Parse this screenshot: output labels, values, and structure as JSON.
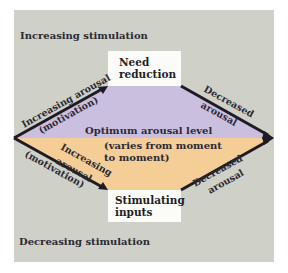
{
  "diagram": {
    "top_label": "Increasing stimulation",
    "bottom_label": "Decreasing stimulation",
    "top_box": {
      "line1": "Need",
      "line2": "reduction"
    },
    "bottom_box": {
      "line1": "Stimulating",
      "line2": "inputs"
    },
    "center": {
      "title": "Optimum arousal level",
      "subtitle_line1": "(varies from moment",
      "subtitle_line2": "to moment)"
    },
    "edges": {
      "upper_left": {
        "line1": "Increasing arousal",
        "line2": "(motivation)"
      },
      "upper_right": {
        "line1": "Decreased",
        "line2": "arousal"
      },
      "lower_left": {
        "line1": "Increasing",
        "line2": "arousal",
        "line3": "(motivation)"
      },
      "lower_right": {
        "line1": "Decreased",
        "line2": "arousal"
      }
    },
    "colors": {
      "background_panel": "#cfd0c8",
      "upper_region": "#cbbfe0",
      "lower_region": "#f4cd97",
      "arrow": "#1e1c22",
      "box": "#fbfbf8"
    }
  }
}
